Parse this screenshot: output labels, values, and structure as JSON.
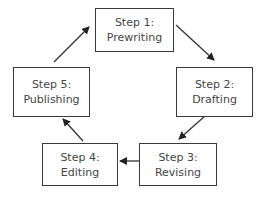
{
  "diagram": {
    "type": "cycle",
    "steps": [
      {
        "title": "Step 1:",
        "name": "Prewriting"
      },
      {
        "title": "Step 2:",
        "name": "Drafting"
      },
      {
        "title": "Step 3:",
        "name": "Revising"
      },
      {
        "title": "Step 4:",
        "name": "Editing"
      },
      {
        "title": "Step 5:",
        "name": "Publishing"
      }
    ],
    "edges": [
      {
        "from": "Step 1",
        "to": "Step 2"
      },
      {
        "from": "Step 2",
        "to": "Step 3"
      },
      {
        "from": "Step 3",
        "to": "Step 4"
      },
      {
        "from": "Step 4",
        "to": "Step 5"
      },
      {
        "from": "Step 5",
        "to": "Step 1"
      }
    ]
  }
}
